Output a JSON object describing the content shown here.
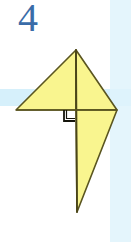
{
  "figure": {
    "label": "4",
    "label_color": "#3a6ca8",
    "background_color": "#ffffff",
    "band_color": "#d6f0fb",
    "shape_fill": "#f9f58f",
    "shape_stroke": "#5a5520",
    "right_angle_mark": "right-angle-square",
    "canvas": {
      "width": 131,
      "height": 242
    },
    "bands": [
      {
        "name": "horizontal-blue-band",
        "x": 0,
        "y": 89,
        "width": 131,
        "height": 17,
        "color": "#d6f0fb"
      },
      {
        "name": "vertical-blue-band",
        "x": 110,
        "y": 0,
        "width": 21,
        "height": 242,
        "color": "#dff3fc"
      }
    ],
    "polygons": [
      {
        "name": "upper-left-triangle",
        "points": "76,50 76,110 16,110"
      },
      {
        "name": "upper-right-triangle",
        "points": "76,50 117,110 76,110"
      },
      {
        "name": "lower-right-triangle",
        "points": "76,110 117,110 77,212"
      }
    ],
    "lines": [
      {
        "name": "central-vertical-fold",
        "x1": 76,
        "y1": 50,
        "x2": 77,
        "y2": 212
      },
      {
        "name": "horizontal-base-line",
        "x1": 16,
        "y1": 110,
        "x2": 117,
        "y2": 110
      }
    ],
    "right_angle": {
      "name": "right-angle-square",
      "x": 64,
      "y": 110,
      "size": 11,
      "stroke": "#1a1a10"
    }
  }
}
